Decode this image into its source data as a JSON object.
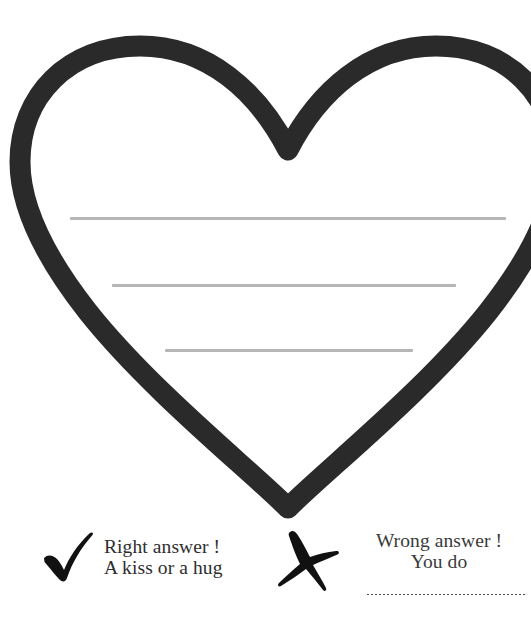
{
  "page": {
    "background_color": "#ffffff"
  },
  "heart": {
    "name": "heart-outline",
    "stroke_color": "#2a2a2a",
    "fill_color": "#ffffff",
    "stroke_width_px": 21,
    "writing_lines": [
      {
        "color": "#b4b6b8",
        "width_px": 436
      },
      {
        "color": "#b4b6b8",
        "width_px": 344
      },
      {
        "color": "#b4b6b8",
        "width_px": 248
      }
    ]
  },
  "answers": {
    "right": {
      "icon": "check-mark-icon",
      "icon_color": "#111111",
      "line1": "Right answer !",
      "line2": "A kiss or a hug",
      "text_color": "#2e2e2e",
      "align": "left"
    },
    "wrong": {
      "icon": "cross-mark-icon",
      "icon_color": "#111111",
      "line1": "Wrong answer !",
      "line2": "You do",
      "text_color": "#3a3a3a",
      "align": "center",
      "blank_rule": "dotted-line"
    }
  }
}
